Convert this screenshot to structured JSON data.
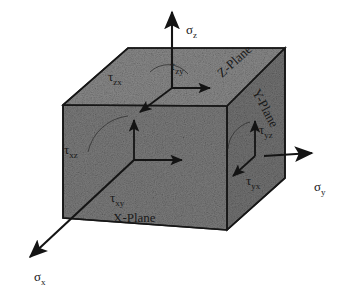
{
  "figure": {
    "type": "stress-element-cube",
    "background_color": "#ffffff",
    "cube_fill_color": "#808080",
    "line_color": "#1a1a1a"
  },
  "normal_stresses": [
    {
      "id": "sigma-z",
      "symbol": "σ",
      "subscript": "z",
      "direction": "up",
      "x": 186,
      "y": 30
    },
    {
      "id": "sigma-y",
      "symbol": "σ",
      "subscript": "y",
      "direction": "right",
      "x": 318,
      "y": 188
    },
    {
      "id": "sigma-x",
      "symbol": "σ",
      "subscript": "x",
      "direction": "down-left",
      "x": 37,
      "y": 277
    }
  ],
  "planes": [
    {
      "id": "z-plane",
      "label": "Z-Plane",
      "face": "top",
      "x": 222,
      "y": 78,
      "rotation": -42
    },
    {
      "id": "y-plane",
      "label": "Y-Plane",
      "face": "right",
      "x": 258,
      "y": 96,
      "rotation": 62
    },
    {
      "id": "x-plane",
      "label": "X-Plane",
      "face": "front",
      "x": 113,
      "y": 219,
      "rotation": 0
    }
  ],
  "shear_stresses": [
    {
      "id": "tau-zx",
      "symbol": "τ",
      "subscript": "zx",
      "face": "top",
      "x": 112,
      "y": 77
    },
    {
      "id": "tau-zy",
      "symbol": "τ",
      "subscript": "zy",
      "face": "top",
      "x": 172,
      "y": 66
    },
    {
      "id": "tau-xz",
      "symbol": "τ",
      "subscript": "xz",
      "face": "front",
      "x": 68,
      "y": 150
    },
    {
      "id": "tau-xy",
      "symbol": "τ",
      "subscript": "xy",
      "face": "front",
      "x": 115,
      "y": 199
    },
    {
      "id": "tau-yz",
      "symbol": "τ",
      "subscript": "yz",
      "face": "right",
      "x": 262,
      "y": 131
    },
    {
      "id": "tau-yx",
      "symbol": "τ",
      "subscript": "yx",
      "face": "right",
      "x": 250,
      "y": 182
    }
  ]
}
